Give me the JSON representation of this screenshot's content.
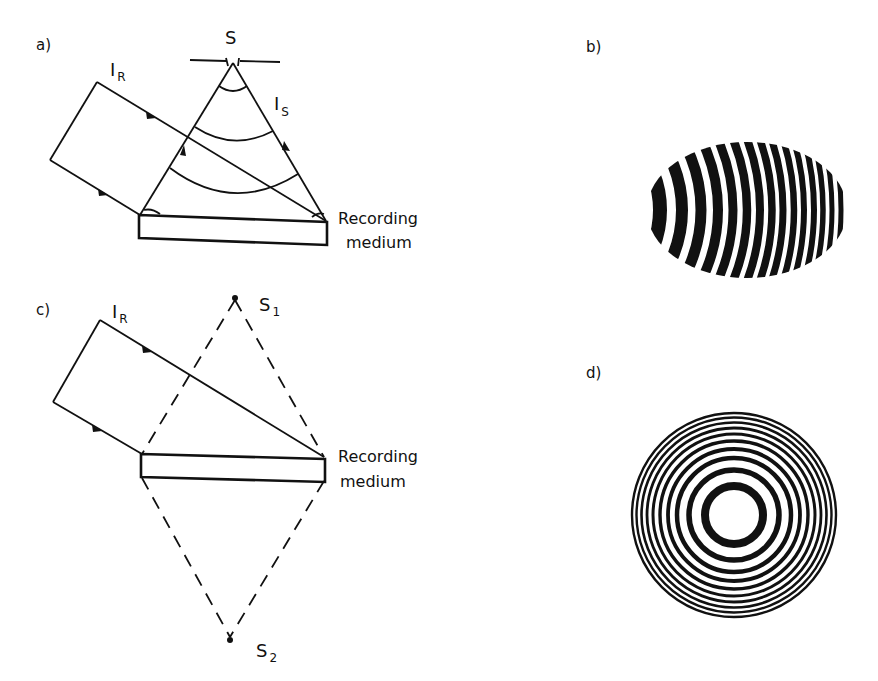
{
  "figure": {
    "panels": [
      {
        "id": "a",
        "label": "a)",
        "reference_beam": {
          "symbol": "I",
          "subscript": "R"
        },
        "source": {
          "symbol": "S"
        },
        "object_beam": {
          "symbol": "I",
          "subscript": "S"
        },
        "medium_label_line1": "Recording",
        "medium_label_line2": "medium"
      },
      {
        "id": "b",
        "label": "b)",
        "pattern": "elliptical-arc-fringes",
        "dark_fringe_count": 15
      },
      {
        "id": "c",
        "label": "c)",
        "reference_beam": {
          "symbol": "I",
          "subscript": "R"
        },
        "real_source": {
          "symbol": "S",
          "subscript": "1"
        },
        "image_source": {
          "symbol": "S",
          "subscript": "2"
        },
        "medium_label_line1": "Recording",
        "medium_label_line2": "medium"
      },
      {
        "id": "d",
        "label": "d)",
        "pattern": "concentric-ring-fringes",
        "ring_count": 10
      }
    ],
    "colors": {
      "ink": "#111111",
      "background": "#ffffff"
    }
  }
}
